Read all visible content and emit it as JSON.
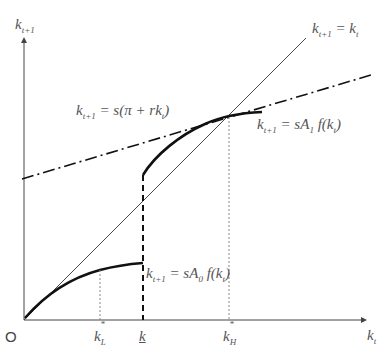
{
  "diagram": {
    "type": "economic-growth-phase-diagram",
    "axes": {
      "y_label_base": "k",
      "y_label_sub": "t+1",
      "x_label_base": "k",
      "x_label_sub": "t",
      "origin_label": "O"
    },
    "curves": {
      "forty_five_line": {
        "lhs": "k",
        "lhs_sub": "t+1",
        "eq": " = k",
        "rhs_sub": "t"
      },
      "dash_dot_line": {
        "lhs": "k",
        "lhs_sub": "t+1",
        "eq": " = s(π + rk",
        "rhs_sub": "t",
        "tail": ")"
      },
      "upper_curve": {
        "lhs": "k",
        "lhs_sub": "t+1",
        "eq": " = sA",
        "a_sub": "1",
        "mid": "f(k",
        "rhs_sub": "t",
        "tail": ")"
      },
      "lower_curve": {
        "lhs": "k",
        "lhs_sub": "t+1",
        "eq": " = sA",
        "a_sub": "0",
        "mid": "f(k",
        "rhs_sub": "t",
        "tail": ")"
      }
    },
    "x_ticks": {
      "kL": {
        "base": "k",
        "sup": "*",
        "sub": "L"
      },
      "kbar": {
        "base": "k"
      },
      "kH": {
        "base": "k",
        "sup": "*",
        "sub": "H"
      }
    },
    "colors": {
      "axis": "#444444",
      "curve": "#111111",
      "guide": "#888888",
      "text": "#555555"
    }
  }
}
